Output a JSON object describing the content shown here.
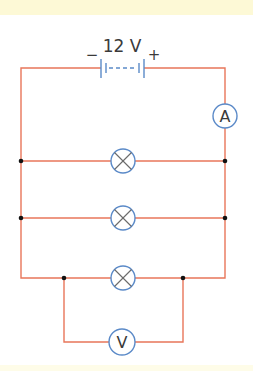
{
  "diagram": {
    "type": "circuit",
    "battery": {
      "label": "12 V",
      "negative_symbol": "−",
      "positive_symbol": "+"
    },
    "ammeter": {
      "label": "A"
    },
    "voltmeter": {
      "label": "V"
    },
    "lamps": [
      {
        "id": "lamp-1",
        "branch": 1
      },
      {
        "id": "lamp-2",
        "branch": 2
      },
      {
        "id": "lamp-3",
        "branch": 3
      }
    ],
    "colors": {
      "wire": "#e8765a",
      "component": "#5b8ac8",
      "band": "#fdf9d6"
    }
  }
}
